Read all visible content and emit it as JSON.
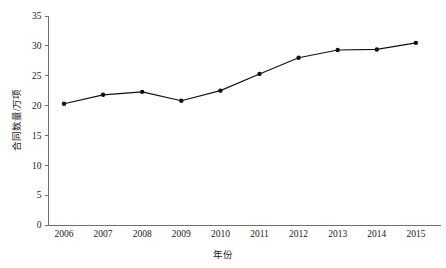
{
  "chart_data": {
    "type": "line",
    "title": "",
    "xlabel": "年份",
    "ylabel": "合同数量/万项",
    "categories": [
      "2006",
      "2007",
      "2008",
      "2009",
      "2010",
      "2011",
      "2012",
      "2013",
      "2014",
      "2015"
    ],
    "values": [
      20.3,
      21.8,
      22.3,
      20.8,
      22.5,
      25.3,
      28.0,
      29.3,
      29.4,
      30.5
    ],
    "series": [
      {
        "name": "合同数量/万项",
        "values": [
          20.3,
          21.8,
          22.3,
          20.8,
          22.5,
          25.3,
          28.0,
          29.3,
          29.4,
          30.5
        ]
      }
    ],
    "ylim": [
      0,
      35
    ],
    "yticks": [
      0,
      5,
      10,
      15,
      20,
      25,
      30,
      35
    ],
    "ytick_labels": [
      "0",
      "5",
      "10",
      "15",
      "20",
      "25",
      "30",
      "35"
    ],
    "xtick_labels": [
      "2006",
      "2007",
      "2008",
      "2009",
      "2010",
      "2011",
      "2012",
      "2013",
      "2014",
      "2015"
    ],
    "grid": false,
    "legend": "none",
    "marker": "filled-circle",
    "line_color": "#101010",
    "marker_color": "#101010",
    "axis_color": "#6f6f6f",
    "background_color": "#ffffff"
  }
}
